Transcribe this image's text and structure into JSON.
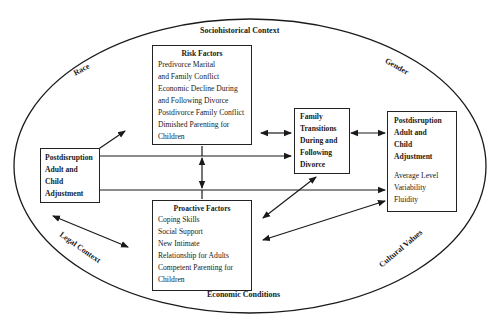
{
  "outer_context": {
    "top": "Sociohistorical Context",
    "bottom": "Economic Conditions",
    "top_left": "Race",
    "top_right": "Gender",
    "bottom_left": "Legal Context",
    "bottom_right": "Cultural Values"
  },
  "risk_factors": {
    "title": "Risk Factors",
    "lines": [
      "Predivorce Marital",
      "and Family Conflict",
      "Economic Decline During",
      "and Following Divorce",
      "Postdivorce Family Conflict",
      "Dimished Parenting for",
      "Children"
    ]
  },
  "proactive_factors": {
    "title": "Proactive Factors",
    "lines": [
      "Coping Skills",
      "Social Support",
      "New Intimate",
      "Relationship for Adults",
      "Competent Parenting for",
      "Children"
    ]
  },
  "left_adjustment": {
    "lines": [
      "Postdisruption",
      "Adult and",
      "Child",
      "Adjustment"
    ]
  },
  "family_transitions": {
    "lines": [
      "Family",
      "Transitions",
      "During and",
      "Following",
      "Divorce"
    ]
  },
  "right_adjustment": {
    "title_lines": [
      "Postdisruption",
      "Adult and",
      "Child",
      "Adjustment"
    ],
    "measures": [
      "Average Level",
      "Variability",
      "Fluidity"
    ]
  }
}
